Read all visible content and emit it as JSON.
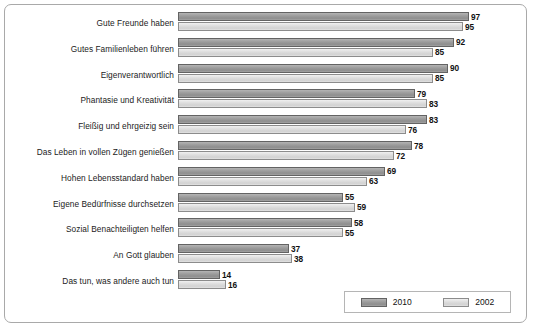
{
  "chart_data": {
    "type": "bar",
    "orientation": "horizontal",
    "title": "",
    "subtitle": "",
    "xlabel": "",
    "ylabel": "",
    "xlim": [
      0,
      100
    ],
    "grid": false,
    "legend_position": "bottom-right",
    "categories": [
      "Gute Freunde haben",
      "Gutes Familienleben führen",
      "Eigenverantwortlich",
      "Phantasie und Kreativität",
      "Fleißig und ehrgeizig sein",
      "Das Leben in vollen Zügen genießen",
      "Hohen Lebensstandard haben",
      "Eigene Bedürfnisse durchsetzen",
      "Sozial Benachteiligten helfen",
      "An Gott glauben",
      "Das tun,  was andere auch tun"
    ],
    "series": [
      {
        "name": "2010",
        "color": "#9d9d9d",
        "values": [
          97,
          92,
          90,
          79,
          83,
          78,
          69,
          55,
          58,
          37,
          14
        ]
      },
      {
        "name": "2002",
        "color": "#dedede",
        "values": [
          95,
          85,
          85,
          83,
          76,
          72,
          63,
          59,
          55,
          38,
          16
        ]
      }
    ]
  },
  "legend": {
    "items": [
      {
        "label": "2010",
        "swatch": "s2010"
      },
      {
        "label": "2002",
        "swatch": "s2002"
      }
    ]
  }
}
